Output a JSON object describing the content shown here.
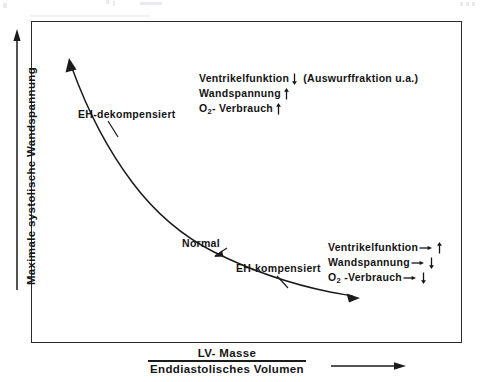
{
  "figure": {
    "axes": {
      "y_label": "Maximale systolische  Wandspannung",
      "x_label_numerator": "LV- Masse",
      "x_label_denominator": "Enddiastolisches Volumen",
      "y_arrow": "up-arrow-icon",
      "x_arrow": "right-arrow-icon"
    },
    "curve": {
      "name": "wall-tension-vs-mass-volume-curve",
      "shape": "hyperbolic-decreasing",
      "start_arrow": "up-left-arrowhead",
      "end_arrow": "right-arrowhead"
    },
    "curve_labels": [
      {
        "id": "eh-dekompensiert",
        "text": "EH-dekompensiert"
      },
      {
        "id": "normal",
        "text": "Normal"
      },
      {
        "id": "eh-kompensiert",
        "text": "EH-kompensiert"
      }
    ],
    "annotations": {
      "decompensated": {
        "id": "decompensated-annotation",
        "lines": [
          {
            "label": "Ventrikelfunktion",
            "arrow": "down",
            "suffix": "(Auswurffraktion u.a.)"
          },
          {
            "label": "Wandspannung",
            "arrow": "up",
            "suffix": ""
          },
          {
            "label": "O2- Verbrauch",
            "arrow": "up",
            "suffix": ""
          }
        ]
      },
      "compensated": {
        "id": "compensated-annotation",
        "lines": [
          {
            "label": "Ventrikelfunktion",
            "lead": "right",
            "arrow": "up"
          },
          {
            "label": "Wandspannung",
            "lead": "right",
            "arrow": "down"
          },
          {
            "label": "O2 -Verbrauch",
            "lead": "right",
            "arrow": "down"
          }
        ]
      }
    },
    "colors": {
      "ink": "#141414",
      "frame": "#2a2a2a",
      "background": "#ffffff"
    }
  }
}
